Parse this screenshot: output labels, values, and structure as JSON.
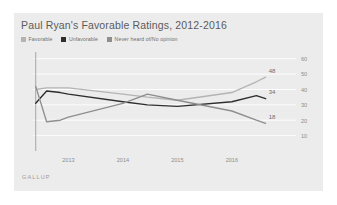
{
  "page": {
    "top_fragment": "               "
  },
  "card": {
    "title": "Paul Ryan's Favorable Ratings, 2012-2016",
    "source": "GALLUP",
    "background": "#ececec"
  },
  "legend": {
    "items": [
      {
        "label": "Favorable",
        "color": "#b4b4b4"
      },
      {
        "label": "Unfavorable",
        "color": "#2e2e2e"
      },
      {
        "label": "Never heard of/No opinion",
        "color": "#8e8e8e"
      }
    ]
  },
  "chart_data": {
    "type": "line",
    "title": "Paul Ryan's Favorable Ratings, 2012-2016",
    "xlabel": "",
    "ylabel": "",
    "ylim": [
      0,
      65
    ],
    "yticks": [
      10,
      20,
      30,
      40,
      50,
      60
    ],
    "ytick_labels": [
      "10",
      "20",
      "30",
      "40",
      "50",
      "60"
    ],
    "grid": true,
    "legend_position": "top-left",
    "xlim": [
      2012.35,
      2016.7
    ],
    "x": [
      2012.4,
      2012.6,
      2012.85,
      2013.0,
      2014.0,
      2014.45,
      2015.0,
      2016.0,
      2016.45,
      2016.62
    ],
    "xticks": [
      2013,
      2014,
      2015,
      2016
    ],
    "xtick_labels": [
      "2013",
      "2014",
      "2015",
      "2016"
    ],
    "series": [
      {
        "name": "Favorable",
        "color": "#b4b4b4",
        "values": [
          40,
          41,
          41,
          41,
          37,
          35,
          33,
          38,
          45,
          48
        ],
        "end_label": "48"
      },
      {
        "name": "Unfavorable",
        "color": "#2e2e2e",
        "values": [
          31,
          39,
          38,
          37,
          32,
          30,
          29,
          32,
          36,
          34
        ],
        "end_label": "34"
      },
      {
        "name": "Never heard of/No opinion",
        "color": "#8e8e8e",
        "values": [
          42,
          19,
          20,
          22,
          31,
          37,
          33,
          26,
          20,
          18
        ],
        "end_label": "18"
      }
    ],
    "annotations": [
      {
        "text": "48",
        "series": "Favorable"
      },
      {
        "text": "34",
        "series": "Unfavorable"
      },
      {
        "text": "18",
        "series": "Never heard of/No opinion"
      }
    ]
  }
}
